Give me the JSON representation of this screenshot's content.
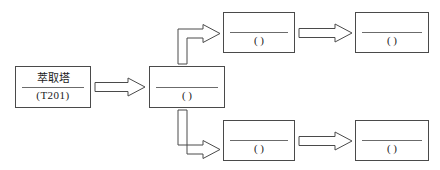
{
  "diagram": {
    "type": "process-flow-diagram",
    "title": "",
    "stroke_color": "#4a4a4a",
    "rule_color": "#6b6b6b",
    "text_color": "#1a1a1a",
    "background_color": "#ffffff",
    "arrow_style": "hollow-block-arrow",
    "nodes": [
      {
        "id": "extraction-tower",
        "top_label": "萃取塔",
        "bottom_label": "(T201)",
        "blank": false,
        "x": 15,
        "y": 66,
        "w": 76,
        "h": 42
      },
      {
        "id": "stage-2",
        "top_label": "",
        "bottom_label": "(     )",
        "blank": true,
        "x": 149,
        "y": 66,
        "w": 76,
        "h": 42
      },
      {
        "id": "branch-top-1",
        "top_label": "",
        "bottom_label": "(     )",
        "blank": true,
        "x": 223,
        "y": 12,
        "w": 72,
        "h": 41
      },
      {
        "id": "branch-top-2",
        "top_label": "",
        "bottom_label": "(     )",
        "blank": true,
        "x": 355,
        "y": 12,
        "w": 74,
        "h": 41
      },
      {
        "id": "branch-bottom-1",
        "top_label": "",
        "bottom_label": "(     )",
        "blank": true,
        "x": 223,
        "y": 120,
        "w": 72,
        "h": 41
      },
      {
        "id": "branch-bottom-2",
        "top_label": "",
        "bottom_label": "(     )",
        "blank": true,
        "x": 355,
        "y": 120,
        "w": 74,
        "h": 41
      }
    ],
    "connectors": [
      {
        "id": "arrow-tower-to-stage2",
        "shape": "straight-right",
        "from": "extraction-tower",
        "to": "stage-2"
      },
      {
        "id": "arrow-stage2-to-branch-top",
        "shape": "elbow-up-right",
        "from": "stage-2",
        "to": "branch-top-1"
      },
      {
        "id": "arrow-stage2-to-branch-bottom",
        "shape": "elbow-down-right",
        "from": "stage-2",
        "to": "branch-bottom-1"
      },
      {
        "id": "arrow-branch-top-1-to-2",
        "shape": "straight-right",
        "from": "branch-top-1",
        "to": "branch-top-2"
      },
      {
        "id": "arrow-branch-bottom-1-to-2",
        "shape": "straight-right",
        "from": "branch-bottom-1",
        "to": "branch-bottom-2"
      }
    ]
  }
}
